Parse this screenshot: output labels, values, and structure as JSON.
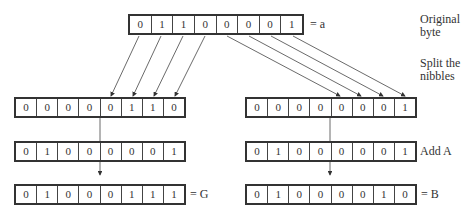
{
  "registers": {
    "original": {
      "bits": [
        "0",
        "1",
        "1",
        "0",
        "0",
        "0",
        "0",
        "1"
      ],
      "label": "= a"
    },
    "high_nibble": {
      "bits": [
        "0",
        "0",
        "0",
        "0",
        "0",
        "1",
        "1",
        "0"
      ]
    },
    "low_nibble": {
      "bits": [
        "0",
        "0",
        "0",
        "0",
        "0",
        "0",
        "0",
        "1"
      ]
    },
    "add_a_left": {
      "bits": [
        "0",
        "1",
        "0",
        "0",
        "0",
        "0",
        "0",
        "1"
      ]
    },
    "add_a_right": {
      "bits": [
        "0",
        "1",
        "0",
        "0",
        "0",
        "0",
        "0",
        "1"
      ]
    },
    "result_g": {
      "bits": [
        "0",
        "1",
        "0",
        "0",
        "0",
        "1",
        "1",
        "1"
      ],
      "label": "= G"
    },
    "result_b": {
      "bits": [
        "0",
        "1",
        "0",
        "0",
        "0",
        "0",
        "1",
        "0"
      ],
      "label": "= B"
    }
  },
  "side_labels": {
    "original_line1": "Original",
    "original_line2": "byte",
    "split_line1": "Split the",
    "split_line2": "nibbles",
    "add": "Add A"
  }
}
